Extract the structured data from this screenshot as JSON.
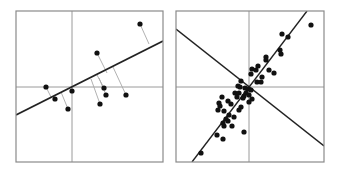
{
  "figure": {
    "colors": {
      "frame": "#8a8a8a",
      "axis": "#9a9a9a",
      "fit_line": "#222222",
      "residual": "#a8a8a8",
      "point": "#111111",
      "background": "#ffffff"
    }
  },
  "panels": [
    {
      "name": "left-panel",
      "frame": {
        "x": 16,
        "y": 11,
        "w": 147,
        "h": 151
      },
      "center": {
        "x": 72,
        "y": 87
      },
      "lines": [
        {
          "name": "fit-line",
          "x1": 16,
          "y1": 115,
          "x2": 163,
          "y2": 41,
          "width": 1.6
        }
      ],
      "points": [
        {
          "x": 140,
          "y": 24
        },
        {
          "x": 97,
          "y": 53
        },
        {
          "x": 46,
          "y": 87
        },
        {
          "x": 55,
          "y": 99
        },
        {
          "x": 72,
          "y": 91
        },
        {
          "x": 68,
          "y": 109
        },
        {
          "x": 104,
          "y": 88
        },
        {
          "x": 106,
          "y": 95
        },
        {
          "x": 100,
          "y": 104
        },
        {
          "x": 126,
          "y": 95
        }
      ],
      "residuals": [
        {
          "x1": 140,
          "y1": 24,
          "x2": 149,
          "y2": 44
        },
        {
          "x1": 97,
          "y1": 53,
          "x2": 107,
          "y2": 73
        },
        {
          "x1": 46,
          "y1": 87,
          "x2": 51,
          "y2": 97
        },
        {
          "x1": 55,
          "y1": 99,
          "x2": 54,
          "y2": 96
        },
        {
          "x1": 68,
          "y1": 109,
          "x2": 61,
          "y2": 92
        },
        {
          "x1": 104,
          "y1": 88,
          "x2": 97,
          "y2": 75
        },
        {
          "x1": 106,
          "y1": 95,
          "x2": 99,
          "y2": 78
        },
        {
          "x1": 100,
          "y1": 104,
          "x2": 91,
          "y2": 79
        },
        {
          "x1": 126,
          "y1": 95,
          "x2": 113,
          "y2": 67
        }
      ]
    },
    {
      "name": "right-panel",
      "frame": {
        "x": 176,
        "y": 11,
        "w": 148,
        "h": 151
      },
      "center": {
        "x": 249,
        "y": 87
      },
      "lines": [
        {
          "name": "first-principal-axis",
          "x1": 192,
          "y1": 162,
          "x2": 307,
          "y2": 11,
          "width": 1.4
        },
        {
          "name": "second-principal-axis",
          "x1": 176,
          "y1": 29,
          "x2": 324,
          "y2": 146,
          "width": 1.4
        }
      ],
      "points": [
        {
          "x": 311,
          "y": 25
        },
        {
          "x": 282,
          "y": 34
        },
        {
          "x": 288,
          "y": 37
        },
        {
          "x": 280,
          "y": 50
        },
        {
          "x": 281,
          "y": 54
        },
        {
          "x": 266,
          "y": 57
        },
        {
          "x": 266,
          "y": 60
        },
        {
          "x": 258,
          "y": 66
        },
        {
          "x": 252,
          "y": 69
        },
        {
          "x": 256,
          "y": 70
        },
        {
          "x": 269,
          "y": 70
        },
        {
          "x": 274,
          "y": 73
        },
        {
          "x": 251,
          "y": 74
        },
        {
          "x": 262,
          "y": 77
        },
        {
          "x": 257,
          "y": 82
        },
        {
          "x": 261,
          "y": 82
        },
        {
          "x": 241,
          "y": 81
        },
        {
          "x": 238,
          "y": 86
        },
        {
          "x": 240,
          "y": 87
        },
        {
          "x": 245,
          "y": 88
        },
        {
          "x": 248,
          "y": 89
        },
        {
          "x": 251,
          "y": 90
        },
        {
          "x": 235,
          "y": 93
        },
        {
          "x": 239,
          "y": 93
        },
        {
          "x": 246,
          "y": 93
        },
        {
          "x": 249,
          "y": 95
        },
        {
          "x": 244,
          "y": 96
        },
        {
          "x": 237,
          "y": 97
        },
        {
          "x": 243,
          "y": 98
        },
        {
          "x": 222,
          "y": 97
        },
        {
          "x": 252,
          "y": 99
        },
        {
          "x": 249,
          "y": 102
        },
        {
          "x": 228,
          "y": 101
        },
        {
          "x": 219,
          "y": 103
        },
        {
          "x": 231,
          "y": 104
        },
        {
          "x": 220,
          "y": 106
        },
        {
          "x": 241,
          "y": 107
        },
        {
          "x": 239,
          "y": 110
        },
        {
          "x": 218,
          "y": 110
        },
        {
          "x": 224,
          "y": 111
        },
        {
          "x": 229,
          "y": 115
        },
        {
          "x": 234,
          "y": 117
        },
        {
          "x": 226,
          "y": 119
        },
        {
          "x": 223,
          "y": 123
        },
        {
          "x": 228,
          "y": 121
        },
        {
          "x": 232,
          "y": 126
        },
        {
          "x": 224,
          "y": 126
        },
        {
          "x": 217,
          "y": 135
        },
        {
          "x": 223,
          "y": 139
        },
        {
          "x": 244,
          "y": 132
        },
        {
          "x": 201,
          "y": 153
        }
      ],
      "residuals": []
    }
  ]
}
